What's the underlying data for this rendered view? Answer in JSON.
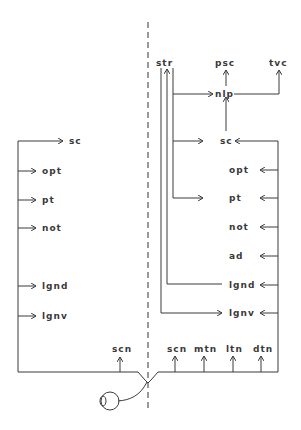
{
  "diagram": {
    "type": "visual pathway schematic",
    "left_hemisphere": {
      "targets": [
        "sc",
        "opt",
        "pt",
        "not",
        "lgnd",
        "lgnv"
      ],
      "input": "scn"
    },
    "right_hemisphere": {
      "top_nodes": [
        "str",
        "psc",
        "tvc",
        "nlp"
      ],
      "targets": [
        "sc",
        "opt",
        "pt",
        "not",
        "ad",
        "lgnd",
        "lgnv"
      ],
      "inputs": [
        "scn",
        "mtn",
        "ltn",
        "dtn"
      ]
    },
    "eye": "eye",
    "midline": "dashed"
  },
  "labels": {
    "l_sc": "sc",
    "l_opt": "opt",
    "l_pt": "pt",
    "l_not": "not",
    "l_lgnd": "lgnd",
    "l_lgnv": "lgnv",
    "l_scn": "scn",
    "str": "str",
    "psc": "psc",
    "tvc": "tvc",
    "nlp": "nlp",
    "r_sc": "sc",
    "r_opt": "opt",
    "r_pt": "pt",
    "r_not": "not",
    "r_ad": "ad",
    "r_lgnd": "lgnd",
    "r_lgnv": "lgnv",
    "r_scn": "scn",
    "r_mtn": "mtn",
    "r_ltn": "ltn",
    "r_dtn": "dtn"
  }
}
